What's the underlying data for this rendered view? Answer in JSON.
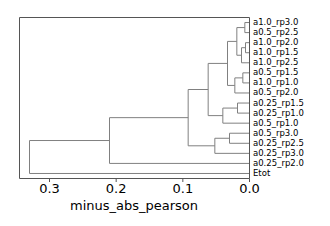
{
  "figure": {
    "width": 330,
    "height": 226,
    "background": "#ffffff",
    "line_color": "#808080",
    "spine_color": "#555555",
    "text_color": "#000000"
  },
  "chart_data": {
    "type": "dendrogram",
    "title": "",
    "xlabel": "minus_abs_pearson",
    "ylabel": "",
    "orientation": "right",
    "xlim": [
      0.345,
      0.0
    ],
    "x_reversed": true,
    "grid": false,
    "legend": null,
    "xticks": [
      0.3,
      0.2,
      0.1,
      0.0
    ],
    "xtick_labels": [
      "0.3",
      "0.2",
      "0.1",
      "0.0"
    ],
    "leaf_labels": [
      "a1.0_rp3.0",
      "a0.5_rp2.5",
      "a1.0_rp2.0",
      "a1.0_rp1.5",
      "a1.0_rp2.5",
      "a0.5_rp1.5",
      "a1.0_rp1.0",
      "a0.5_rp2.0",
      "a0.25_rp1.5",
      "a0.25_rp1.0",
      "a0.5_rp1.0",
      "a0.5_rp3.0",
      "a0.25_rp2.5",
      "a0.25_rp3.0",
      "a0.25_rp2.0",
      "Etot"
    ],
    "leaf_count": 16,
    "merges": [
      {
        "id": 16,
        "left": 0,
        "right": 1,
        "height": 0.007
      },
      {
        "id": 17,
        "left": 2,
        "right": 3,
        "height": 0.006
      },
      {
        "id": 18,
        "left": 17,
        "right": 4,
        "height": 0.012
      },
      {
        "id": 19,
        "left": 16,
        "right": 18,
        "height": 0.019
      },
      {
        "id": 20,
        "left": 5,
        "right": 6,
        "height": 0.01
      },
      {
        "id": 21,
        "left": 20,
        "right": 7,
        "height": 0.022
      },
      {
        "id": 22,
        "left": 19,
        "right": 21,
        "height": 0.033
      },
      {
        "id": 23,
        "left": 8,
        "right": 9,
        "height": 0.018
      },
      {
        "id": 24,
        "left": 23,
        "right": 10,
        "height": 0.04
      },
      {
        "id": 25,
        "left": 22,
        "right": 24,
        "height": 0.062
      },
      {
        "id": 26,
        "left": 11,
        "right": 12,
        "height": 0.03
      },
      {
        "id": 27,
        "left": 26,
        "right": 13,
        "height": 0.052
      },
      {
        "id": 28,
        "left": 25,
        "right": 27,
        "height": 0.092
      },
      {
        "id": 29,
        "left": 28,
        "right": 14,
        "height": 0.21
      },
      {
        "id": 30,
        "left": 29,
        "right": 15,
        "height": 0.33
      }
    ]
  }
}
